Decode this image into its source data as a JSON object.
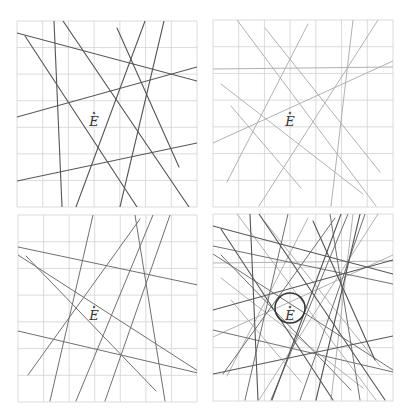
{
  "figure": {
    "panel_count": 4,
    "grid": {
      "cols": 7,
      "rows": 7,
      "color": "#d2d2d2"
    },
    "point_label": "E",
    "colors": {
      "set_a": "#555555",
      "set_b": "#a8a8a8",
      "set_c": "#707070",
      "circle": "#333333",
      "point": "#666666"
    }
  },
  "panels": [
    {
      "id": "top-left",
      "x": 17,
      "y": 21,
      "w": 180,
      "h": 186,
      "point": {
        "x": 77,
        "y": 92
      },
      "line_sets": [
        "a"
      ],
      "circle": null
    },
    {
      "id": "top-right",
      "x": 213,
      "y": 20,
      "w": 180,
      "h": 187,
      "point": {
        "x": 77,
        "y": 93
      },
      "line_sets": [
        "b"
      ],
      "circle": null
    },
    {
      "id": "bottom-left",
      "x": 18,
      "y": 215,
      "w": 179,
      "h": 187,
      "point": {
        "x": 76,
        "y": 92
      },
      "line_sets": [
        "c"
      ],
      "circle": null
    },
    {
      "id": "bottom-right",
      "x": 213,
      "y": 214,
      "w": 180,
      "h": 187,
      "point": {
        "x": 77,
        "y": 93
      },
      "line_sets": [
        "a",
        "b",
        "c"
      ],
      "circle": {
        "cx": 77,
        "cy": 94,
        "r": 15
      }
    }
  ],
  "line_sets": {
    "a": [
      [
        0,
        12,
        180,
        60
      ],
      [
        8,
        15,
        120,
        186
      ],
      [
        37,
        0,
        45,
        186
      ],
      [
        46,
        0,
        172,
        186
      ],
      [
        100,
        7,
        162,
        146
      ],
      [
        128,
        0,
        59,
        186
      ],
      [
        147,
        0,
        103,
        186
      ],
      [
        0,
        96,
        180,
        46
      ],
      [
        0,
        160,
        180,
        122
      ]
    ],
    "b": [
      [
        24,
        0,
        163,
        186
      ],
      [
        52,
        8,
        167,
        152
      ],
      [
        0,
        49,
        180,
        47
      ],
      [
        8,
        64,
        150,
        174
      ],
      [
        0,
        123,
        180,
        41
      ],
      [
        95,
        4,
        14,
        162
      ],
      [
        140,
        0,
        118,
        186
      ],
      [
        165,
        0,
        46,
        186
      ],
      [
        18,
        86,
        88,
        168
      ]
    ],
    "c": [
      [
        0,
        32,
        180,
        70
      ],
      [
        0,
        40,
        180,
        156
      ],
      [
        8,
        41,
        138,
        176
      ],
      [
        75,
        0,
        32,
        186
      ],
      [
        122,
        4,
        10,
        160
      ],
      [
        135,
        0,
        58,
        186
      ],
      [
        152,
        0,
        87,
        186
      ],
      [
        117,
        0,
        147,
        186
      ],
      [
        0,
        116,
        180,
        158
      ]
    ]
  }
}
